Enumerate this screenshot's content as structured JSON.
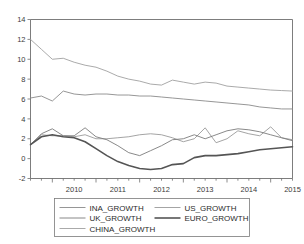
{
  "figure": {
    "background": "#ffffff",
    "axis_color": "#6e6e6e",
    "text_color": "#3b3b3b"
  },
  "chart_data": {
    "type": "line",
    "title": "",
    "xlabel": "",
    "ylabel": "",
    "ylim": [
      -2,
      14
    ],
    "ytick_labels": [
      "14",
      "12",
      "10",
      "8",
      "6",
      "4",
      "2",
      "0",
      "-2"
    ],
    "ytick_values": [
      14,
      12,
      10,
      8,
      6,
      4,
      2,
      0,
      -2
    ],
    "xtick_labels": [
      "2010",
      "2011",
      "2012",
      "2013",
      "2014",
      "2015"
    ],
    "xtick_values": [
      2010,
      2011,
      2012,
      2013,
      2014,
      2015
    ],
    "x_minor_ticks_per_year": 4,
    "grid": false,
    "legend_position": "below-center",
    "x_start": 2009.5,
    "x_end": 2015.5,
    "x": [
      2009.5,
      2009.75,
      2010.0,
      2010.25,
      2010.5,
      2010.75,
      2011.0,
      2011.25,
      2011.5,
      2011.75,
      2012.0,
      2012.25,
      2012.5,
      2012.75,
      2013.0,
      2013.25,
      2013.5,
      2013.75,
      2014.0,
      2014.25,
      2014.5,
      2014.75,
      2015.0,
      2015.25,
      2015.5
    ],
    "series": [
      {
        "name": "INA_GROWTH",
        "color": "#8a8a8a",
        "width": 0.9,
        "values": [
          6.1,
          6.3,
          5.8,
          6.8,
          6.5,
          6.4,
          6.5,
          6.5,
          6.4,
          6.4,
          6.3,
          6.3,
          6.2,
          6.1,
          6.0,
          5.9,
          5.8,
          5.7,
          5.6,
          5.5,
          5.4,
          5.2,
          5.1,
          5.0,
          5.0
        ]
      },
      {
        "name": "US_GROWTH",
        "color": "#9a9a9a",
        "width": 0.9,
        "values": [
          1.4,
          2.4,
          2.3,
          2.3,
          2.2,
          2.4,
          2.0,
          2.0,
          2.1,
          2.2,
          2.4,
          2.5,
          2.4,
          2.1,
          1.7,
          2.0,
          3.1,
          1.6,
          2.0,
          2.8,
          2.5,
          2.3,
          3.2,
          2.1,
          1.9
        ]
      },
      {
        "name": "UK_GROWTH",
        "color": "#7c7c7c",
        "width": 0.9,
        "values": [
          1.4,
          2.5,
          3.0,
          2.3,
          2.3,
          3.1,
          2.2,
          1.9,
          1.3,
          0.6,
          0.3,
          0.8,
          1.3,
          1.9,
          2.0,
          2.4,
          2.0,
          2.4,
          2.8,
          3.0,
          2.9,
          2.7,
          2.4,
          2.1,
          1.8
        ]
      },
      {
        "name": "EURO_GROWTH",
        "color": "#555555",
        "width": 1.6,
        "values": [
          1.4,
          2.2,
          2.4,
          2.2,
          2.1,
          1.7,
          1.0,
          0.3,
          -0.3,
          -0.7,
          -1.0,
          -1.1,
          -1.0,
          -0.6,
          -0.5,
          0.1,
          0.3,
          0.3,
          0.4,
          0.5,
          0.7,
          0.9,
          1.0,
          1.1,
          1.2
        ]
      },
      {
        "name": "CHINA_GROWTH",
        "color": "#a0a0a0",
        "width": 0.9,
        "values": [
          12.0,
          11.0,
          10.0,
          10.1,
          9.7,
          9.4,
          9.2,
          8.8,
          8.3,
          8.0,
          7.8,
          7.5,
          7.4,
          7.9,
          7.7,
          7.5,
          7.7,
          7.6,
          7.3,
          7.2,
          7.1,
          7.0,
          6.9,
          6.85,
          6.8
        ]
      }
    ],
    "legend_entries": [
      {
        "label": "INA_GROWTH",
        "color": "#8a8a8a",
        "width": 0.9,
        "col": 0,
        "row": 0
      },
      {
        "label": "US_GROWTH",
        "color": "#9a9a9a",
        "width": 0.9,
        "col": 1,
        "row": 0
      },
      {
        "label": "UK_GROWTH",
        "color": "#7c7c7c",
        "width": 0.9,
        "col": 0,
        "row": 1
      },
      {
        "label": "EURO_GROWTH",
        "color": "#555555",
        "width": 1.6,
        "col": 1,
        "row": 1
      },
      {
        "label": "CHINA_GROWTH",
        "color": "#a0a0a0",
        "width": 0.9,
        "col": 0,
        "row": 2
      }
    ]
  }
}
